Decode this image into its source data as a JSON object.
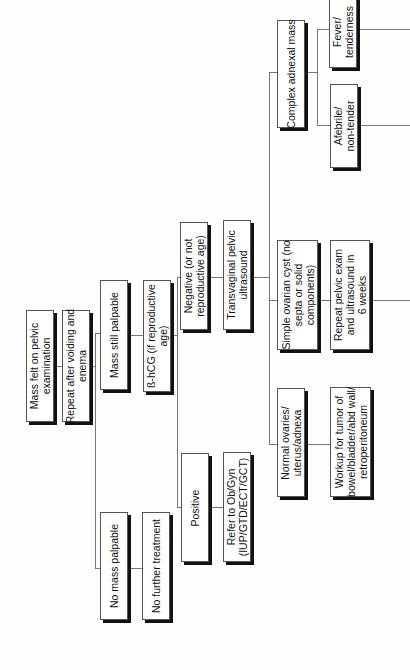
{
  "flowchart": {
    "orientation": "rotated-90-ccw",
    "nodes": {
      "mass_felt": "Mass felt on pelvic\nexamination",
      "repeat_voiding": "Repeat after voiding and\nenema",
      "mass_still": "Mass still palpable",
      "bhcg": "ß-hCG (if reproductive\nage)",
      "negative": "Negative (or not\nreproductive age)",
      "tvus": "Transvaginal pelvic\nultrasound",
      "positive": "Positive",
      "refer": "Refer to Ob/Gyn\n(IUP/GTD/ECT/GCT)",
      "no_mass": "No mass palpable",
      "no_treatment": "No further treatment",
      "complex": "Complex adnexal mass",
      "fever": "Fever/\ntenderness",
      "afebrile": "Afebrile/\nnon-tender",
      "simple_cyst": "Simple ovarian cyst (no\nsepta or solid\ncomponents)",
      "repeat_exam": "Repeat pelvic exam\nand ultrasound in\n6 weeks",
      "normal": "Normal ovaries/\nuterus/adnexa",
      "workup": "Workup for tumor of\nbowel/bladder/abd wall/\nretroperitoneum"
    }
  }
}
